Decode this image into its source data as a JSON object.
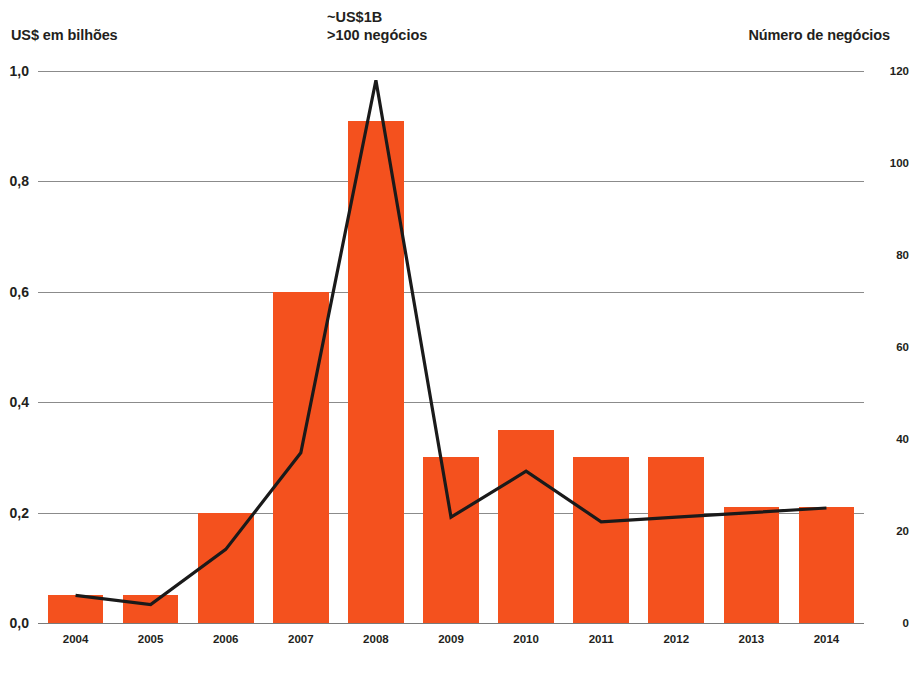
{
  "left_axis": {
    "title": "US$ em bilhões",
    "ticks": [
      "0,0",
      "0,2",
      "0,4",
      "0,6",
      "0,8",
      "1,0"
    ]
  },
  "right_axis": {
    "title": "Número de negócios",
    "ticks": [
      "0",
      "20",
      "40",
      "60",
      "80",
      "100",
      "120"
    ]
  },
  "annotation": {
    "line1": "~US$1B",
    "line2": ">100 negócios"
  },
  "colors": {
    "bar": "#f4511e",
    "line": "#1a1a1a",
    "grid": "#8b8b8b",
    "text": "#231f20"
  },
  "chart_data": {
    "type": "bar",
    "title": "",
    "subtitle": "",
    "xlabel": "",
    "ylabel": "US$ em bilhões",
    "y2label": "Número de negócios",
    "categories": [
      "2004",
      "2005",
      "2006",
      "2007",
      "2008",
      "2009",
      "2010",
      "2011",
      "2012",
      "2013",
      "2014"
    ],
    "ylim": [
      0,
      1.0
    ],
    "y2lim": [
      0,
      120
    ],
    "yticks": [
      0,
      0.2,
      0.4,
      0.6,
      0.8,
      1.0
    ],
    "y2ticks": [
      0,
      20,
      40,
      60,
      80,
      100,
      120
    ],
    "grid": true,
    "legend": "none",
    "annotations": [
      {
        "text": "~US$1B",
        "at_category": "2008",
        "axis": "left"
      },
      {
        "text": ">100 negócios",
        "at_category": "2008",
        "axis": "right"
      }
    ],
    "series": [
      {
        "name": "US$ em bilhões",
        "type": "bar",
        "axis": "left",
        "color": "#f4511e",
        "values": [
          0.05,
          0.05,
          0.2,
          0.6,
          0.91,
          0.3,
          0.35,
          0.3,
          0.3,
          0.21,
          0.21
        ]
      },
      {
        "name": "Número de negócios",
        "type": "line",
        "axis": "right",
        "color": "#1a1a1a",
        "values": [
          6,
          4,
          16,
          37,
          118,
          23,
          33,
          22,
          23,
          24,
          25
        ]
      }
    ]
  }
}
